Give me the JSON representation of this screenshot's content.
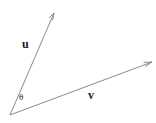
{
  "figure": {
    "background_color": "#ffffff",
    "line_color": "#8a8a8a",
    "label_color": "#1a1a1a",
    "width": 156,
    "height": 123
  },
  "geometry": {
    "origin": {
      "x": 10,
      "y": 115
    },
    "vectors": [
      {
        "name": "u",
        "label": "u",
        "tip": {
          "x": 54,
          "y": 13
        },
        "arrowhead": "open-arrow"
      },
      {
        "name": "v",
        "label": "v",
        "tip": {
          "x": 152,
          "y": 62
        },
        "arrowhead": "open-arrow"
      }
    ],
    "angle": {
      "name": "theta",
      "label": "θ",
      "position": {
        "x": 22,
        "y": 97
      }
    }
  },
  "labels": {
    "u": "u",
    "v": "v",
    "theta": "θ"
  }
}
